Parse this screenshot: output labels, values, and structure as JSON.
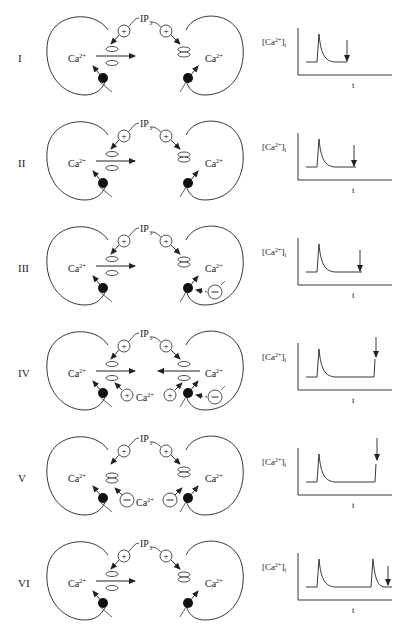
{
  "labels": {
    "ca": "Ca",
    "ca_sup": "2+",
    "ip3": "IP",
    "ip3_sub": "3",
    "plus": "+",
    "minus": "−",
    "graph_ylabel": "[Ca",
    "graph_ylabel_sup": "2+",
    "graph_ylabel_end": "]",
    "graph_ylabel_sub": "i",
    "graph_xlabel": "t"
  },
  "rows": [
    {
      "id": "I",
      "label": "I",
      "left_channel": "open",
      "right_channel": "closed",
      "inhibitor_right": false,
      "bidirectional": false,
      "ca_feedback": "none",
      "trace": "single_spike_arrow_mid"
    },
    {
      "id": "II",
      "label": "II",
      "left_channel": "open",
      "right_channel": "closed",
      "inhibitor_right": false,
      "bidirectional": false,
      "ca_feedback": "none",
      "trace": "single_spike_arrow_end"
    },
    {
      "id": "III",
      "label": "III",
      "left_channel": "open",
      "right_channel": "closed",
      "inhibitor_right": true,
      "bidirectional": false,
      "ca_feedback": "none",
      "trace": "single_spike_arrow_end_long"
    },
    {
      "id": "IV",
      "label": "IV",
      "left_channel": "open",
      "right_channel": "open",
      "inhibitor_right": true,
      "bidirectional": true,
      "ca_feedback": "positive",
      "trace": "spike_then_rise"
    },
    {
      "id": "V",
      "label": "V",
      "left_channel": "closed",
      "right_channel": "closed",
      "inhibitor_right": false,
      "bidirectional": false,
      "ca_feedback": "negative",
      "trace": "spike_then_rise_partial"
    },
    {
      "id": "VI",
      "label": "VI",
      "left_channel": "open",
      "right_channel": "closed",
      "inhibitor_right": false,
      "bidirectional": false,
      "ca_feedback": "none",
      "trace": "two_spikes"
    }
  ]
}
